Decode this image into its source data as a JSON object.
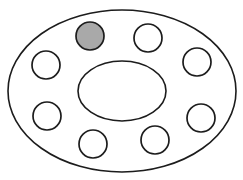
{
  "diagram": {
    "description": "Hand-drawn ring of eight circles between an outer ellipse and an inner ellipse; one circle is shaded",
    "colors": {
      "stroke": "#1c1c1c",
      "background": "#ffffff",
      "shaded_fill": "#a9a9a9",
      "empty_fill": "#ffffff"
    },
    "outer_ellipse": {
      "cx": 122,
      "cy": 91,
      "rx": 114,
      "ry": 81
    },
    "inner_ellipse": {
      "cx": 122,
      "cy": 91,
      "rx": 44,
      "ry": 30
    },
    "circles": [
      {
        "id": "top-left",
        "cx": 90,
        "cy": 36,
        "r": 14,
        "shaded": true
      },
      {
        "id": "top-right",
        "cx": 148,
        "cy": 38,
        "r": 14,
        "shaded": false
      },
      {
        "id": "right-upper",
        "cx": 197,
        "cy": 62,
        "r": 14,
        "shaded": false
      },
      {
        "id": "right-lower",
        "cx": 201,
        "cy": 118,
        "r": 14,
        "shaded": false
      },
      {
        "id": "bottom-right",
        "cx": 155,
        "cy": 140,
        "r": 14,
        "shaded": false
      },
      {
        "id": "bottom-left",
        "cx": 93,
        "cy": 144,
        "r": 14,
        "shaded": false
      },
      {
        "id": "left-lower",
        "cx": 47,
        "cy": 116,
        "r": 14,
        "shaded": false
      },
      {
        "id": "left-upper",
        "cx": 46,
        "cy": 65,
        "r": 14,
        "shaded": false
      }
    ],
    "counts": {
      "total_circles": 8,
      "shaded_circles": 1
    }
  }
}
